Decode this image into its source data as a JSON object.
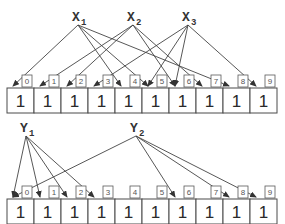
{
  "colors": {
    "line": "#444444",
    "cell_border": "#4a4a4a",
    "text": "#2a2a2a",
    "index_text": "#555555"
  },
  "diagrams": [
    {
      "name": "top-array",
      "cells_y": 88,
      "index_y": 75,
      "values": [
        "1",
        "1",
        "1",
        "1",
        "1",
        "1",
        "1",
        "1",
        "1",
        "1"
      ],
      "indices": [
        "0",
        "1",
        "2",
        "3",
        "4",
        "5",
        "6",
        "7",
        "8",
        "9"
      ],
      "sources": [
        {
          "label": "X",
          "sub": "1",
          "x": 78,
          "y": 16,
          "targets": [
            0,
            4,
            5,
            8
          ]
        },
        {
          "label": "X",
          "sub": "2",
          "x": 133,
          "y": 16,
          "targets": [
            1,
            2,
            6,
            7
          ]
        },
        {
          "label": "X",
          "sub": "3",
          "x": 188,
          "y": 16,
          "targets": [
            3,
            5,
            6,
            9
          ]
        }
      ]
    },
    {
      "name": "bottom-array",
      "cells_y": 199,
      "index_y": 186,
      "values": [
        "1",
        "1",
        "1",
        "1",
        "1",
        "1",
        "1",
        "1",
        "1",
        "1"
      ],
      "indices": [
        "0",
        "1",
        "2",
        "3",
        "4",
        "5",
        "6",
        "7",
        "8",
        "9"
      ],
      "sources": [
        {
          "label": "Y",
          "sub": "1",
          "x": 26,
          "y": 127,
          "targets": [
            0,
            1,
            2,
            3
          ]
        },
        {
          "label": "Y",
          "sub": "2",
          "x": 136,
          "y": 127,
          "targets": [
            0,
            6,
            8,
            9
          ]
        }
      ]
    }
  ]
}
